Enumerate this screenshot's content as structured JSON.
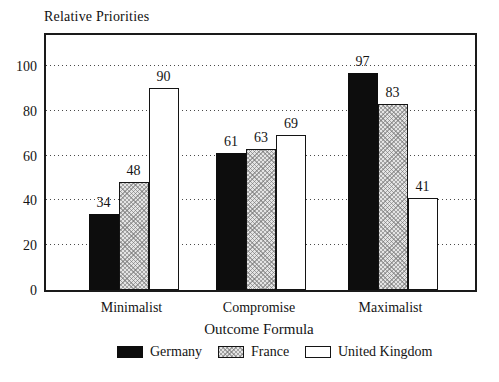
{
  "chart_data": {
    "type": "bar",
    "title": "Relative Priorities",
    "xlabel": "Outcome Formula",
    "ylabel": "",
    "categories": [
      "Minimalist",
      "Compromise",
      "Maximalist"
    ],
    "series": [
      {
        "name": "Germany",
        "pattern": "solid",
        "color": "#0d0d0d",
        "values": [
          34,
          61,
          97
        ]
      },
      {
        "name": "France",
        "pattern": "crosshatch",
        "color": "#e4e4e4",
        "values": [
          48,
          63,
          83
        ]
      },
      {
        "name": "United Kingdom",
        "pattern": "open",
        "color": "#ffffff",
        "values": [
          90,
          69,
          41
        ]
      }
    ],
    "y_ticks": [
      0,
      20,
      40,
      60,
      80,
      100
    ],
    "ylim": [
      0,
      114
    ],
    "grid": "horizontal-dotted",
    "legend_position": "bottom",
    "value_labels": true,
    "frame_color": "#1a1a1a",
    "background_color": "#ffffff"
  }
}
